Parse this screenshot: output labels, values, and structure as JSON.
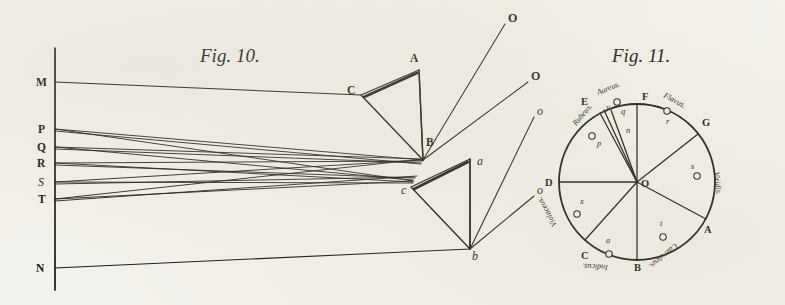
{
  "plate": {
    "background_color": "#f4f2ec",
    "ink_color": "#1b1a17",
    "width": 785,
    "height": 305
  },
  "fig10": {
    "title": "Fig. 10.",
    "title_pos": {
      "x": 200,
      "y": 62
    },
    "axis": {
      "x": 55,
      "y1": 48,
      "y2": 290
    },
    "source_points": [
      {
        "label": "M",
        "label_x": 36,
        "label_y": 86,
        "x": 55,
        "y": 82
      },
      {
        "label": "P",
        "label_x": 38,
        "label_y": 133,
        "x": 55,
        "y": 129
      },
      {
        "label": "Q",
        "label_x": 37,
        "label_y": 151,
        "x": 55,
        "y": 147
      },
      {
        "label": "R",
        "label_x": 37,
        "label_y": 167,
        "x": 55,
        "y": 163
      },
      {
        "label": "S",
        "label_x": 38,
        "label_y": 186,
        "x": 55,
        "y": 182
      },
      {
        "label": "T",
        "label_x": 38,
        "label_y": 203,
        "x": 55,
        "y": 199
      },
      {
        "label": "N",
        "label_x": 36,
        "label_y": 272,
        "x": 55,
        "y": 268
      }
    ],
    "upper_prism": {
      "apex_label": "A",
      "apex": {
        "x": 419,
        "y": 70
      },
      "left_label": "C",
      "left": {
        "x": 361,
        "y": 95
      },
      "lower_label": "B",
      "lower": {
        "x": 421,
        "y": 148
      },
      "base": {
        "x": 423,
        "y": 160
      },
      "label_A": {
        "x": 410,
        "y": 62
      },
      "label_C": {
        "x": 347,
        "y": 94
      },
      "label_B": {
        "x": 426,
        "y": 146
      }
    },
    "lower_prism": {
      "apex_label": "a",
      "apex": {
        "x": 470,
        "y": 159
      },
      "left_label": "c",
      "left": {
        "x": 411,
        "y": 187
      },
      "lower_label": "b",
      "lower": {
        "x": 470,
        "y": 249
      },
      "label_a": {
        "x": 477,
        "y": 165
      },
      "label_c": {
        "x": 401,
        "y": 194
      },
      "label_b": {
        "x": 472,
        "y": 260
      }
    },
    "emergent_rays": [
      {
        "label": "O",
        "from": {
          "x": 423,
          "y": 160
        },
        "to": {
          "x": 505,
          "y": 24
        },
        "label_x": 508,
        "label_y": 22
      },
      {
        "label": "O",
        "from": {
          "x": 423,
          "y": 160
        },
        "to": {
          "x": 528,
          "y": 82
        },
        "label_x": 531,
        "label_y": 80
      },
      {
        "label": "o",
        "from": {
          "x": 470,
          "y": 249
        },
        "to": {
          "x": 534,
          "y": 117
        },
        "label_x": 537,
        "label_y": 115
      },
      {
        "label": "o",
        "from": {
          "x": 470,
          "y": 249
        },
        "to": {
          "x": 534,
          "y": 196
        },
        "label_x": 537,
        "label_y": 194
      }
    ],
    "converge_upper": {
      "x": 423,
      "y": 160
    },
    "converge_lower": {
      "x": 411,
      "y": 182
    }
  },
  "fig11": {
    "title": "Fig. 11.",
    "title_pos": {
      "x": 612,
      "y": 62
    },
    "center": {
      "x": 637,
      "y": 182
    },
    "center_label": "O",
    "center_label_pos": {
      "x": 641,
      "y": 187
    },
    "radius": 78,
    "rim_points": [
      {
        "label": "D",
        "angle_deg": 180,
        "label_x": 545,
        "label_y": 186
      },
      {
        "label": "E",
        "angle_deg": 118,
        "label_x": 581,
        "label_y": 105
      },
      {
        "label": "F",
        "angle_deg": 90,
        "label_x": 642,
        "label_y": 100
      },
      {
        "label": "G",
        "angle_deg": 38,
        "label_x": 702,
        "label_y": 126
      },
      {
        "label": "A",
        "angle_deg": 332,
        "label_x": 704,
        "label_y": 233
      },
      {
        "label": "B",
        "angle_deg": 270,
        "label_x": 634,
        "label_y": 271
      },
      {
        "label": "C",
        "angle_deg": 228,
        "label_x": 581,
        "label_y": 259
      }
    ],
    "sectors": [
      {
        "colour": "Rubeus.",
        "marker": "p",
        "colour_x": 576,
        "colour_y": 126,
        "colour_rot": -50,
        "marker_x": 592,
        "marker_y": 136,
        "letter": "p",
        "letter_x": 597,
        "letter_y": 146
      },
      {
        "colour": "Aureus.",
        "marker": "q",
        "colour_x": 598,
        "colour_y": 95,
        "colour_rot": -22,
        "marker_x": 617,
        "marker_y": 102,
        "letter": "q",
        "letter_x": 621,
        "letter_y": 114
      },
      {
        "colour": "Flavus.",
        "marker": "r",
        "colour_x": 663,
        "colour_y": 97,
        "colour_rot": 28,
        "marker_x": 667,
        "marker_y": 111,
        "letter": "r",
        "letter_x": 666,
        "letter_y": 124
      },
      {
        "colour": "Viridis.",
        "marker": "s",
        "colour_x": 714,
        "colour_y": 172,
        "colour_rot": 84,
        "marker_x": 697,
        "marker_y": 176,
        "letter": "s",
        "letter_x": 691,
        "letter_y": 169
      },
      {
        "colour": "Caeruleus.",
        "marker": "t",
        "colour_x": 675,
        "colour_y": 243,
        "colour_rot": 140,
        "marker_x": 663,
        "marker_y": 237,
        "letter": "t",
        "letter_x": 660,
        "letter_y": 226
      },
      {
        "colour": "Indicus.",
        "marker": "u",
        "colour_x": 608,
        "colour_y": 265,
        "colour_rot": 183,
        "marker_x": 609,
        "marker_y": 254,
        "letter": "a",
        "letter_x": 606,
        "letter_y": 243
      },
      {
        "colour": "Violaceus.",
        "marker": "x",
        "colour_x": 557,
        "colour_y": 225,
        "colour_rot": -119,
        "marker_x": 577,
        "marker_y": 214,
        "letter": "x",
        "letter_x": 580,
        "letter_y": 204
      }
    ],
    "inner_marks": [
      {
        "letter": "n",
        "x": 626,
        "y": 133
      },
      {
        "letter": "y",
        "x": 609,
        "y": 108
      }
    ]
  }
}
